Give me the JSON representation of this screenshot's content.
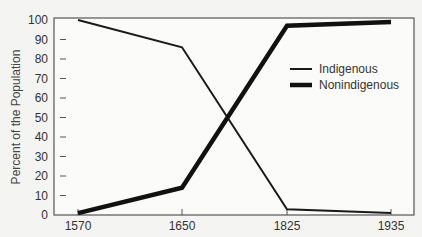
{
  "chart_data": {
    "type": "line",
    "title": "",
    "xlabel": "",
    "ylabel": "Percent of the Population",
    "categories": [
      "1570",
      "1650",
      "1825",
      "1935"
    ],
    "ylim": [
      0,
      100
    ],
    "yticks": [
      0,
      10,
      20,
      30,
      40,
      50,
      60,
      70,
      80,
      90,
      100
    ],
    "grid": false,
    "legend_position": "upper right (inside)",
    "series": [
      {
        "name": "Indigenous",
        "values": [
          100,
          86,
          3,
          1
        ],
        "line_width": 2,
        "color": "#1a1a1a"
      },
      {
        "name": "Nonindigenous",
        "values": [
          1,
          14,
          97,
          99
        ],
        "line_width": 4.5,
        "color": "#111111"
      }
    ]
  },
  "legend": {
    "items": [
      {
        "label": "Indigenous"
      },
      {
        "label": "Nonindigenous"
      }
    ]
  },
  "colors": {
    "background": "#f4f4f2",
    "frame": "#555555",
    "line": "#111111"
  }
}
